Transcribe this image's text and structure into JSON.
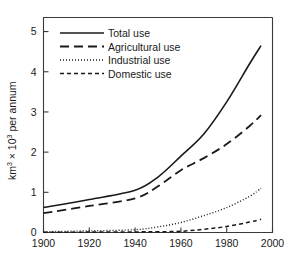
{
  "chart_data": {
    "type": "line",
    "title": "",
    "subtitle": "",
    "xlabel": "",
    "ylabel": "km3 x 103 per annum",
    "ylabel_parts": {
      "base1": "km",
      "sup1": "3",
      "times": " × 10",
      "sup2": "3",
      "tail": " per annum"
    },
    "xlim": [
      1900,
      2000
    ],
    "ylim": [
      0,
      5.35
    ],
    "xticks": [
      1900,
      1920,
      1940,
      1960,
      1980,
      2000
    ],
    "xtick_labels": [
      "1900",
      "1920",
      "1940",
      "1960",
      "1980",
      "2000"
    ],
    "yticks": [
      0,
      1,
      2,
      3,
      4,
      5
    ],
    "ytick_labels": [
      "0",
      "1",
      "2",
      "3",
      "4",
      "5"
    ],
    "grid": false,
    "legend_position": "top-left",
    "x": [
      1900,
      1920,
      1940,
      1950,
      1960,
      1970,
      1980,
      1990,
      1995
    ],
    "series": [
      {
        "name": "Total use",
        "style": "solid",
        "values": [
          0.62,
          0.82,
          1.05,
          1.38,
          1.9,
          2.45,
          3.25,
          4.2,
          4.65
        ]
      },
      {
        "name": "Agricultural use",
        "style": "long-dash",
        "values": [
          0.48,
          0.66,
          0.85,
          1.15,
          1.55,
          1.85,
          2.2,
          2.65,
          2.92
        ]
      },
      {
        "name": "Industrial use",
        "style": "dotted",
        "values": [
          0.02,
          0.04,
          0.07,
          0.14,
          0.25,
          0.42,
          0.62,
          0.9,
          1.1
        ]
      },
      {
        "name": "Domestic use",
        "style": "short-dash",
        "values": [
          0.005,
          0.01,
          0.015,
          0.02,
          0.03,
          0.08,
          0.15,
          0.26,
          0.33
        ]
      }
    ]
  },
  "legend": {
    "items": [
      {
        "label": "Total use"
      },
      {
        "label": "Agricultural use"
      },
      {
        "label": "Industrial use"
      },
      {
        "label": "Domestic use"
      }
    ]
  },
  "colors": {
    "ink": "#1a1a1a",
    "axis": "#3a3a3a",
    "background": "#ffffff"
  }
}
